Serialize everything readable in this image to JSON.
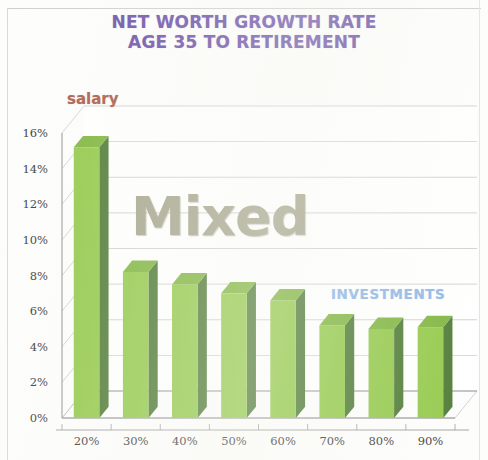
{
  "chart_data": {
    "type": "bar",
    "title": "NET WORTH GROWTH RATE AGE 35 TO RETIREMENT",
    "title_lines": [
      "NET WORTH GROWTH RATE",
      "AGE 35 TO RETIREMENT"
    ],
    "xlabel": "",
    "ylabel": "",
    "categories": [
      "20%",
      "30%",
      "40%",
      "50%",
      "60%",
      "70%",
      "80%",
      "90%"
    ],
    "values": [
      15.2,
      8.2,
      7.5,
      7.0,
      6.6,
      5.2,
      5.0,
      5.1
    ],
    "value_labels": [
      "15.2%",
      "8.2%",
      "7.5%",
      "7.0%",
      "6.6%",
      "5.2%",
      "5.0%",
      "5.1%"
    ],
    "ylim": [
      0,
      16
    ],
    "ytick_values": [
      0,
      2,
      4,
      6,
      8,
      10,
      12,
      14,
      16
    ],
    "ytick_labels": [
      "0%",
      "2%",
      "4%",
      "6%",
      "8%",
      "10%",
      "12%",
      "14%",
      "16%"
    ],
    "grid": true,
    "legend_position": "none",
    "series": [
      {
        "name": "Net worth growth rate",
        "values": [
          15.2,
          8.2,
          7.5,
          7.0,
          6.6,
          5.2,
          5.0,
          5.1
        ],
        "color": "#93c94a",
        "side_color": "#4e7a35",
        "top_color": "#7fb53f"
      }
    ],
    "annotations": [
      {
        "id": "salary",
        "text": "salary",
        "color": "#a85b4a"
      },
      {
        "id": "mixed",
        "text": "Mixed",
        "color": "#a5a58d"
      },
      {
        "id": "investments",
        "text": "INVESTMENTS",
        "color": "#8fb6e6"
      }
    ]
  },
  "colors": {
    "title": "#6b4fa8",
    "bar_face": "#93c94a",
    "bar_side": "#4e7a35",
    "bar_top": "#7fb53f",
    "grid": "#b9b9b9",
    "axis": "#8c8c8c",
    "tick_text": "#3a3a3a",
    "page_background": "#fdfdfc"
  }
}
